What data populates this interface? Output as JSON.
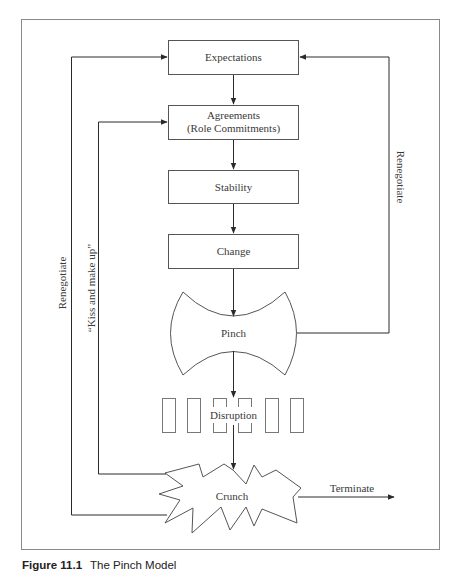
{
  "figure": {
    "caption_number": "Figure 11.1",
    "caption_title": "The Pinch Model"
  },
  "nodes": {
    "expectations": "Expectations",
    "agreements_line1": "Agreements",
    "agreements_line2": "(Role Commitments)",
    "stability": "Stability",
    "change": "Change",
    "pinch": "Pinch",
    "disruption": "Disruption",
    "crunch": "Crunch"
  },
  "edges": {
    "renegotiate_right": "Renegotiate",
    "renegotiate_left": "Renegotiate",
    "kiss_and_make_up": "“Kiss and make up”",
    "terminate": "Terminate"
  },
  "colors": {
    "line": "#3a3a3a",
    "frame": "#8a8a8a",
    "background": "#ffffff"
  }
}
